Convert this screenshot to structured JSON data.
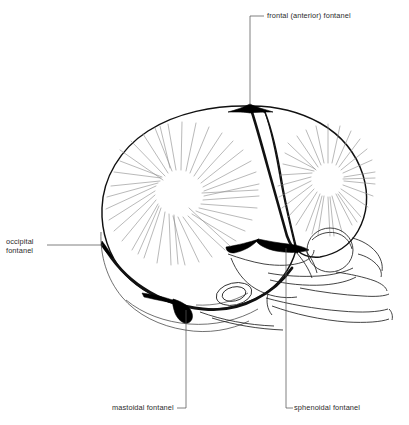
{
  "figure": {
    "view": "lateral",
    "background_color": "#ffffff",
    "outline_color": "#111111",
    "fontanel_fill_color": "#000000",
    "hatch_color": "#8a8a8a",
    "leader_color": "#555555",
    "text_color": "#2b2b2b"
  },
  "labels": {
    "frontal": "frontal (anterior) fontanel",
    "occipital_line1": "occipital",
    "occipital_line2": "fontanel",
    "mastoidal": "mastoidal fontanel",
    "sphenoidal": "sphenoidal fontanel"
  },
  "structures": {
    "parietal_bone": "parietal bone",
    "frontal_bone": "frontal bone",
    "occipital_bone": "occipital bone",
    "temporal_bone": "temporal bone",
    "maxilla": "maxilla",
    "mandible": "mandible",
    "orbit": "orbit",
    "coronal_suture": "coronal suture",
    "lambdoid_suture": "lambdoid suture",
    "squamous_suture": "squamous suture"
  },
  "ossification_centers": [
    {
      "name": "parietal-center",
      "x": 178,
      "y": 186
    },
    {
      "name": "frontal-center",
      "x": 328,
      "y": 176
    }
  ],
  "leaders": [
    {
      "name": "frontal-leader",
      "from_x": 250,
      "from_y": 105,
      "to_x": 250,
      "to_y": 16,
      "elbow_x": 264,
      "elbow_y": 16
    },
    {
      "name": "occipital-leader",
      "from_x": 103,
      "from_y": 245,
      "to_x": 47,
      "to_y": 245
    },
    {
      "name": "mastoidal-leader",
      "from_x": 186,
      "from_y": 310,
      "to_x": 186,
      "to_y": 408,
      "elbow_x": 176,
      "elbow_y": 408
    },
    {
      "name": "sphenoidal-leader",
      "from_x": 286,
      "from_y": 248,
      "to_x": 286,
      "to_y": 408,
      "elbow_x": 294,
      "elbow_y": 408
    }
  ]
}
